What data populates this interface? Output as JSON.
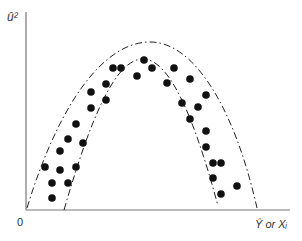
{
  "diagram": {
    "y_axis_label": "û²",
    "x_axis_label": "Ŷ or Xᵢ",
    "origin_label": "0",
    "colors": {
      "axis": "#777777",
      "points": "#111111",
      "bands": "#222222"
    },
    "points": [
      [
        144,
        60
      ],
      [
        152,
        68
      ],
      [
        113,
        68
      ],
      [
        121,
        68
      ],
      [
        137,
        76
      ],
      [
        106,
        84
      ],
      [
        91,
        92
      ],
      [
        106,
        100
      ],
      [
        91,
        108
      ],
      [
        76,
        124
      ],
      [
        68,
        139
      ],
      [
        83,
        143
      ],
      [
        60,
        151
      ],
      [
        45,
        167
      ],
      [
        60,
        170
      ],
      [
        76,
        167
      ],
      [
        52,
        183
      ],
      [
        68,
        183
      ],
      [
        52,
        198
      ],
      [
        174,
        68
      ],
      [
        167,
        83
      ],
      [
        190,
        79
      ],
      [
        206,
        95
      ],
      [
        182,
        103
      ],
      [
        198,
        107
      ],
      [
        190,
        119
      ],
      [
        206,
        131
      ],
      [
        206,
        147
      ],
      [
        213,
        163
      ],
      [
        221,
        163
      ],
      [
        213,
        178
      ],
      [
        237,
        186
      ],
      [
        221,
        194
      ]
    ]
  }
}
